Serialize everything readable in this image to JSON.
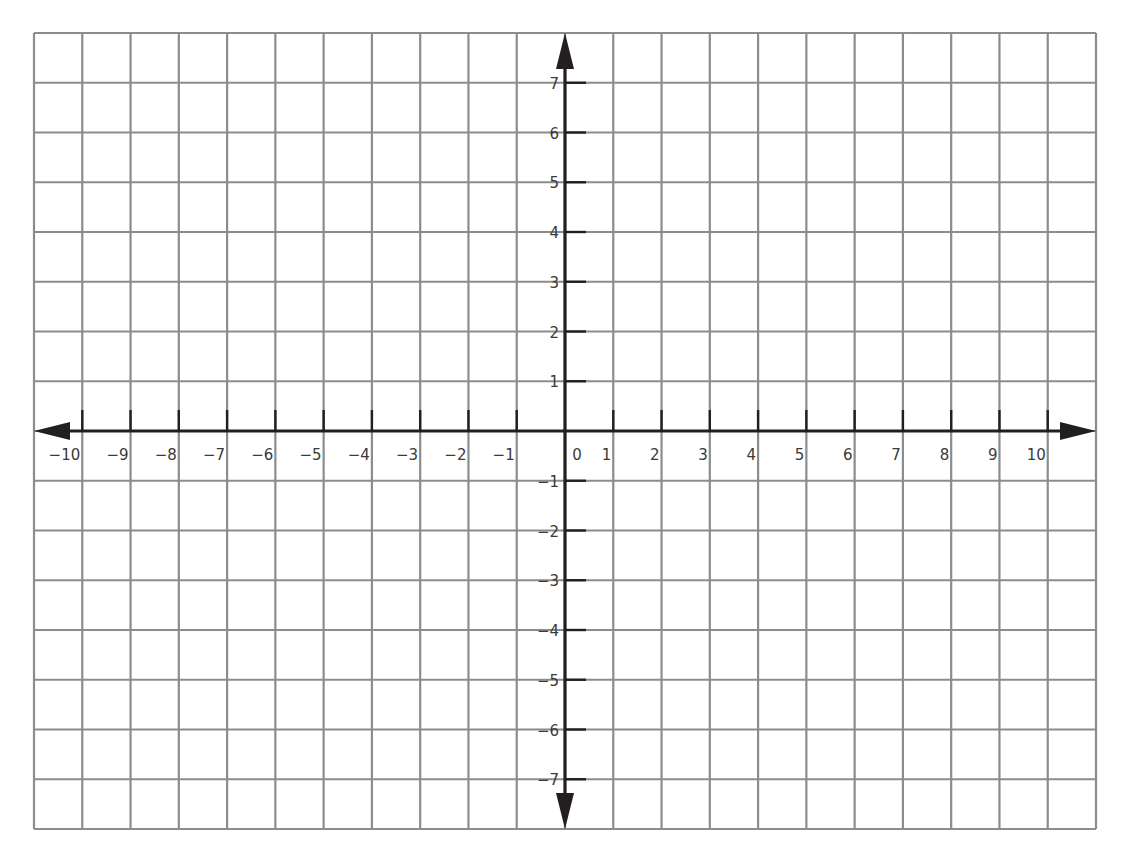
{
  "chart_data": {
    "type": "line",
    "title": "",
    "xlabel": "",
    "ylabel": "",
    "xlim": [
      -11,
      11
    ],
    "ylim": [
      -8,
      8
    ],
    "grid": true,
    "arrows": [
      "left",
      "right",
      "up",
      "down"
    ],
    "origin_label": "0",
    "x_ticks": [
      -10,
      -9,
      -8,
      -7,
      -6,
      -5,
      -4,
      -3,
      -2,
      -1,
      1,
      2,
      3,
      4,
      5,
      6,
      7,
      8,
      9,
      10
    ],
    "x_tick_labels": [
      "−10",
      "−9",
      "−8",
      "−7",
      "−6",
      "−5",
      "−4",
      "−3",
      "−2",
      "−1",
      "1",
      "2",
      "3",
      "4",
      "5",
      "6",
      "7",
      "8",
      "9",
      "10"
    ],
    "y_ticks": [
      7,
      6,
      5,
      4,
      3,
      2,
      1,
      -1,
      -2,
      -3,
      -4,
      -5,
      -6,
      -7
    ],
    "y_tick_labels": [
      "7",
      "6",
      "5",
      "4",
      "3",
      "2",
      "1",
      "−1",
      "−2",
      "−3",
      "−4",
      "−5",
      "−6",
      "−7"
    ],
    "series": []
  },
  "colors": {
    "grid": "#8c8c8c",
    "axis": "#231f20",
    "label": "#3a3a3a",
    "background": "#ffffff"
  }
}
